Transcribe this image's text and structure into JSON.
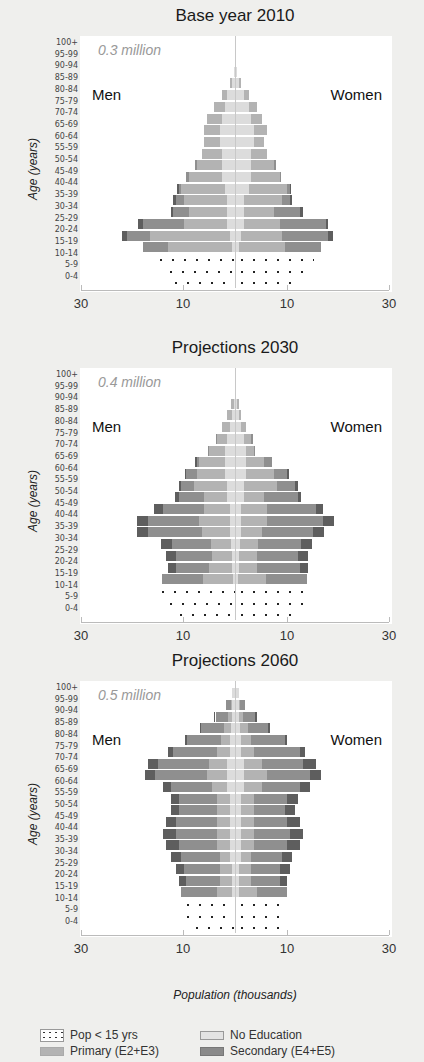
{
  "chart_data": [
    {
      "type": "bar",
      "orientation": "horizontal-population-pyramid",
      "title": "Base year 2010",
      "total_label": "0.3 million",
      "left_label": "Men",
      "right_label": "Women",
      "ylabel": "Age (years)",
      "xlabel": "Population (thousands)",
      "xlim": [
        30,
        30
      ],
      "x_ticks": [
        "30",
        "10",
        "10",
        "30"
      ],
      "categories": [
        "0-4",
        "5-9",
        "10-14",
        "15-19",
        "20-24",
        "25-29",
        "30-34",
        "35-39",
        "40-44",
        "45-49",
        "50-54",
        "55-59",
        "60-64",
        "65-69",
        "70-74",
        "75-79",
        "80-84",
        "85-89",
        "90-94",
        "95-99",
        "100+"
      ],
      "series_order": [
        "No Education",
        "Primary (E2+E3)",
        "Secondary (E4+E5)",
        "Tertiary"
      ],
      "men": {
        "under15": [
          12.7,
          13.6,
          15.6,
          0,
          0,
          0,
          0,
          0,
          0,
          0,
          0,
          0,
          0,
          0,
          0,
          0,
          0,
          0,
          0,
          0,
          0
        ],
        "none": [
          0,
          0,
          0,
          0.5,
          1.0,
          1.5,
          1.5,
          1.5,
          2.0,
          2.5,
          2.5,
          2.5,
          3.0,
          3.0,
          2.5,
          2.0,
          1.5,
          0.6,
          0.1,
          0,
          0
        ],
        "primary": [
          0,
          0,
          0,
          12.5,
          15.5,
          8.5,
          7.5,
          8.5,
          8.5,
          6.5,
          5.0,
          4.0,
          3.0,
          3.0,
          3.0,
          2.0,
          1.0,
          0.3,
          0,
          0,
          0
        ],
        "secondary": [
          0,
          0,
          0,
          5.0,
          4.5,
          8.0,
          3.0,
          1.5,
          0.5,
          0.5,
          0.3,
          0,
          0,
          0,
          0,
          0,
          0,
          0,
          0,
          0,
          0
        ],
        "tertiary": [
          0,
          0,
          0,
          0,
          1.0,
          1.0,
          0.5,
          0.5,
          0.3,
          0,
          0,
          0,
          0,
          0,
          0,
          0,
          0,
          0,
          0,
          0,
          0
        ]
      },
      "women": {
        "under15": [
          10.7,
          13.6,
          15.2,
          0,
          0,
          0,
          0,
          0,
          0,
          0,
          0,
          0,
          0,
          0,
          0,
          0,
          0,
          0,
          0,
          0,
          0
        ],
        "none": [
          0,
          0,
          0,
          0.5,
          1.0,
          1.5,
          1.5,
          1.5,
          2.5,
          3.0,
          3.0,
          3.0,
          3.5,
          3.5,
          3.0,
          2.5,
          1.5,
          0.6,
          0.1,
          0,
          0
        ],
        "primary": [
          0,
          0,
          0,
          9.0,
          8.0,
          7.0,
          6.0,
          7.5,
          7.5,
          5.5,
          4.5,
          3.0,
          2.0,
          2.5,
          2.0,
          1.5,
          1.0,
          0.3,
          0,
          0,
          0
        ],
        "secondary": [
          0,
          0,
          0,
          7.0,
          9.0,
          9.0,
          5.0,
          1.5,
          0.5,
          0.3,
          0.3,
          0,
          0,
          0,
          0,
          0,
          0,
          0,
          0,
          0,
          0
        ],
        "tertiary": [
          0,
          0,
          0,
          0,
          1.0,
          0.5,
          0.5,
          0.5,
          0.3,
          0,
          0,
          0,
          0,
          0,
          0,
          0,
          0,
          0,
          0,
          0,
          0
        ]
      }
    },
    {
      "type": "bar",
      "orientation": "horizontal-population-pyramid",
      "title": "Projections 2030",
      "total_label": "0.4 million",
      "left_label": "Men",
      "right_label": "Women",
      "ylabel": "Age (years)",
      "xlabel": "Population (thousands)",
      "xlim": [
        30,
        30
      ],
      "x_ticks": [
        "30",
        "10",
        "10",
        "30"
      ],
      "categories": [
        "0-4",
        "5-9",
        "10-14",
        "15-19",
        "20-24",
        "25-29",
        "30-34",
        "35-39",
        "40-44",
        "45-49",
        "50-54",
        "55-59",
        "60-64",
        "65-69",
        "70-74",
        "75-79",
        "80-84",
        "85-89",
        "90-94",
        "95-99",
        "100+"
      ],
      "series_order": [
        "No Education",
        "Primary (E2+E3)",
        "Secondary (E4+E5)",
        "Tertiary"
      ],
      "men": {
        "under15": [
          11.7,
          13.6,
          15.2,
          0,
          0,
          0,
          0,
          0,
          0,
          0,
          0,
          0,
          0,
          0,
          0,
          0,
          0,
          0,
          0,
          0,
          0
        ],
        "none": [
          0,
          0,
          0,
          0.3,
          0.5,
          0.5,
          0.7,
          1.0,
          1.0,
          1.0,
          1.5,
          1.5,
          2.0,
          2.0,
          2.0,
          1.5,
          1.0,
          0.5,
          0.2,
          0,
          0
        ],
        "primary": [
          0,
          0,
          0,
          6.0,
          4.5,
          4.0,
          4.0,
          5.5,
          6.0,
          5.0,
          4.5,
          6.5,
          5.5,
          5.0,
          3.0,
          2.0,
          1.5,
          1.0,
          0.5,
          0,
          0
        ],
        "secondary": [
          0,
          0,
          0,
          8.0,
          6.5,
          7.0,
          7.5,
          10.5,
          10.0,
          8.0,
          5.0,
          2.5,
          2.0,
          0.5,
          0.3,
          0.3,
          0,
          0,
          0,
          0,
          0
        ],
        "tertiary": [
          0,
          0,
          0,
          0,
          1.5,
          2.0,
          2.2,
          2.2,
          2.2,
          1.7,
          0.7,
          0.5,
          0.3,
          0.2,
          0,
          0,
          0,
          0,
          0,
          0,
          0
        ]
      },
      "women": {
        "under15": [
          10.7,
          13.0,
          13.6,
          0,
          0,
          0,
          0,
          0,
          0,
          0,
          0,
          0,
          0,
          0,
          0,
          0,
          0,
          0,
          0,
          0,
          0
        ],
        "none": [
          0,
          0,
          0,
          0.3,
          0.5,
          0.5,
          0.7,
          1.0,
          1.0,
          1.0,
          1.5,
          1.5,
          2.0,
          2.0,
          2.0,
          1.5,
          1.0,
          0.5,
          0.2,
          0,
          0
        ],
        "primary": [
          0,
          0,
          0,
          5.5,
          3.5,
          3.5,
          3.5,
          4.0,
          5.0,
          5.0,
          4.0,
          6.5,
          5.5,
          3.5,
          1.5,
          1.5,
          1.0,
          0.5,
          0.3,
          0,
          0
        ],
        "secondary": [
          0,
          0,
          0,
          8.0,
          8.5,
          8.0,
          8.5,
          10.0,
          11.0,
          9.5,
          6.5,
          3.5,
          2.5,
          1.5,
          0.3,
          0.3,
          0,
          0,
          0,
          0,
          0
        ],
        "tertiary": [
          0,
          0,
          0,
          0,
          1.5,
          2.0,
          2.2,
          2.2,
          2.2,
          1.5,
          0.7,
          0.5,
          0.3,
          0,
          0,
          0,
          0,
          0,
          0,
          0,
          0
        ]
      }
    },
    {
      "type": "bar",
      "orientation": "horizontal-population-pyramid",
      "title": "Projections 2060",
      "total_label": "0.5 million",
      "left_label": "Men",
      "right_label": "Women",
      "ylabel": "Age (years)",
      "xlabel": "Population (thousands)",
      "xlim": [
        30,
        30
      ],
      "x_ticks": [
        "30",
        "10",
        "10",
        "30"
      ],
      "categories": [
        "0-4",
        "5-9",
        "10-14",
        "15-19",
        "20-24",
        "25-29",
        "30-34",
        "35-39",
        "40-44",
        "45-49",
        "50-54",
        "55-59",
        "60-64",
        "65-69",
        "70-74",
        "75-79",
        "80-84",
        "85-89",
        "90-94",
        "95-99",
        "100+"
      ],
      "series_order": [
        "No Education",
        "Primary (E2+E3)",
        "Secondary (E4+E5)",
        "Tertiary"
      ],
      "men": {
        "under15": [
          8.6,
          10.3,
          10.3,
          0,
          0,
          0,
          0,
          0,
          0,
          0,
          0,
          0,
          0,
          0,
          0,
          0,
          0,
          0,
          0,
          0,
          0
        ],
        "none": [
          0,
          0,
          0,
          0.5,
          0.5,
          0.5,
          1.0,
          1.0,
          1.0,
          1.0,
          1.0,
          1.0,
          1.5,
          1.5,
          1.5,
          1.0,
          1.0,
          0.8,
          0.5,
          0.5,
          0.5
        ],
        "primary": [
          0,
          0,
          0,
          3.0,
          2.5,
          2.5,
          2.0,
          2.5,
          2.5,
          2.5,
          2.5,
          2.5,
          3.0,
          4.0,
          3.5,
          2.5,
          1.8,
          1.3,
          0.8,
          0.3,
          0
        ],
        "secondary": [
          0,
          0,
          0,
          7.0,
          6.5,
          7.0,
          7.5,
          7.5,
          8.0,
          8.0,
          7.5,
          7.5,
          8.0,
          10.0,
          10.0,
          8.5,
          6.5,
          4.5,
          2.5,
          1.0,
          0
        ],
        "tertiary": [
          0,
          0,
          0,
          0,
          1.5,
          1.5,
          2.0,
          2.5,
          2.5,
          2.0,
          1.5,
          1.5,
          1.5,
          2.0,
          2.0,
          1.0,
          0.5,
          0.3,
          0.2,
          0,
          0
        ]
      },
      "women": {
        "under15": [
          8.6,
          9.8,
          10.0,
          0,
          0,
          0,
          0,
          0,
          0,
          0,
          0,
          0,
          0,
          0,
          0,
          0,
          0,
          0,
          0,
          0,
          0
        ],
        "none": [
          0,
          0,
          0,
          0.5,
          0.5,
          0.5,
          1.0,
          1.0,
          1.0,
          1.0,
          1.0,
          1.0,
          1.5,
          1.5,
          1.5,
          1.0,
          1.0,
          0.8,
          0.5,
          0.5,
          0.5
        ],
        "primary": [
          0,
          0,
          0,
          3.5,
          2.5,
          2.5,
          2.0,
          2.5,
          2.5,
          2.5,
          2.5,
          2.5,
          3.5,
          4.5,
          3.5,
          2.5,
          2.0,
          1.5,
          0.8,
          0.3,
          0
        ],
        "secondary": [
          0,
          0,
          0,
          6.0,
          5.5,
          5.5,
          6.0,
          6.5,
          7.0,
          6.5,
          6.0,
          6.5,
          7.5,
          8.5,
          8.0,
          9.0,
          6.5,
          4.0,
          2.5,
          1.0,
          0
        ],
        "tertiary": [
          0,
          0,
          0,
          0,
          1.5,
          2.0,
          2.0,
          2.5,
          2.5,
          2.5,
          2.0,
          2.0,
          2.0,
          2.0,
          2.5,
          1.0,
          0.5,
          0.3,
          0.2,
          0,
          0
        ]
      }
    }
  ],
  "panels": [
    {
      "title": "Base year 2010",
      "total": "0.3 million",
      "men": "Men",
      "women": "Women"
    },
    {
      "title": "Projections 2030",
      "total": "0.4 million",
      "men": "Men",
      "women": "Women"
    },
    {
      "title": "Projections 2060",
      "total": "0.5 million",
      "men": "Men",
      "women": "Women"
    }
  ],
  "age_groups": [
    "100+",
    "95-99",
    "90-94",
    "85-89",
    "80-84",
    "75-79",
    "70-74",
    "65-69",
    "60-64",
    "55-59",
    "50-54",
    "45-49",
    "40-44",
    "35-39",
    "30-34",
    "25-29",
    "20-24",
    "15-19",
    "10-14",
    "5-9",
    "0-4"
  ],
  "ylabel": "Age (years)",
  "x_ticks": [
    "30",
    "10",
    "10",
    "30"
  ],
  "xlabel": "Population (thousands)",
  "legend": [
    {
      "key": "u15",
      "label": "Pop < 15 yrs"
    },
    {
      "key": "none",
      "label": "No Education"
    },
    {
      "key": "prim",
      "label": "Primary (E2+E3)"
    },
    {
      "key": "sec",
      "label": "Secondary (E4+E5)"
    }
  ]
}
